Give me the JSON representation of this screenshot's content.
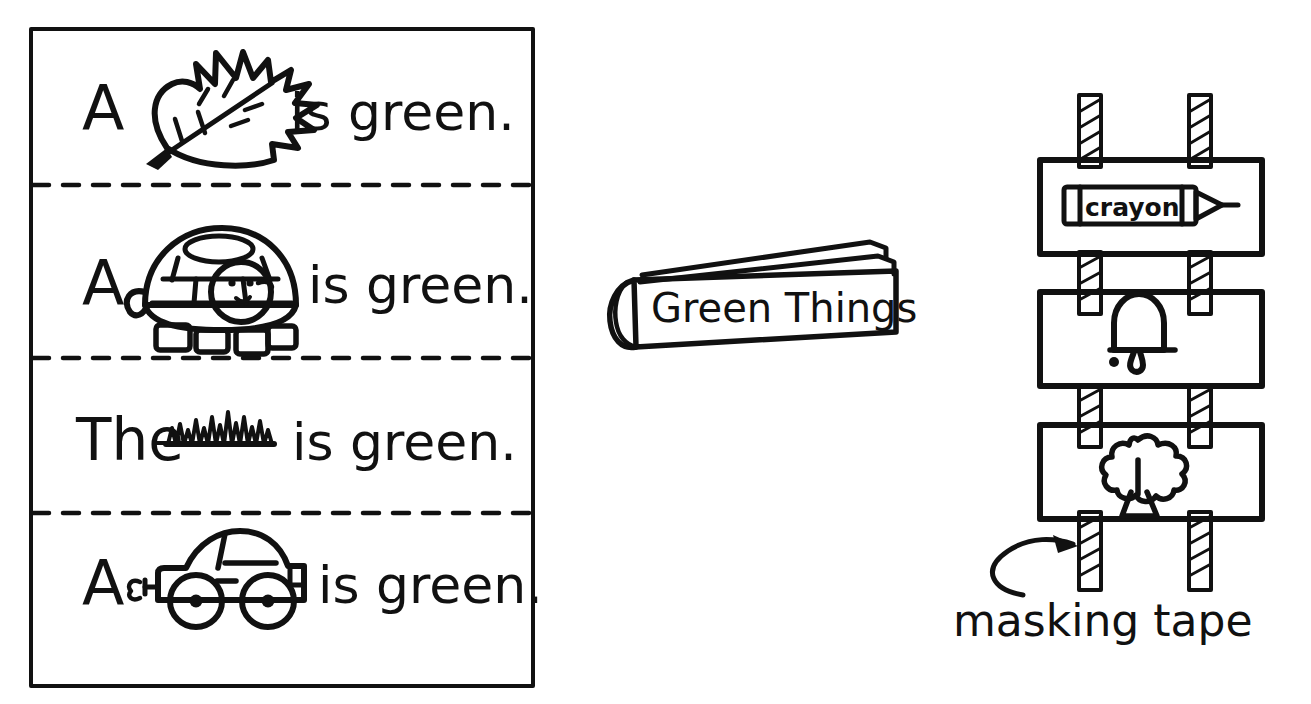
{
  "page": {
    "background_color": "#ffffff",
    "ink_color": "#111111",
    "width": 1311,
    "height": 704
  },
  "sentence_strip_panel": {
    "name": "sentence-strips-box",
    "border_style": "solid",
    "divider_style": "dashed",
    "strips": [
      {
        "index": 1,
        "lead_word": "A",
        "picture": "leaf-icon",
        "picture_label": "leaf",
        "trailing_text": "is green."
      },
      {
        "index": 2,
        "lead_word": "A",
        "picture": "turtle-icon",
        "picture_label": "turtle",
        "trailing_text": "is green."
      },
      {
        "index": 3,
        "lead_word": "The",
        "picture": "grass-icon",
        "picture_label": "grass",
        "trailing_text": "is green."
      },
      {
        "index": 4,
        "lead_word": "A",
        "picture": "car-icon",
        "picture_label": "car",
        "trailing_text": "is green."
      }
    ]
  },
  "book": {
    "name": "green-things-book",
    "cover_title": "Green Things"
  },
  "tape_board": {
    "name": "taped-cards-board",
    "tape_count": 2,
    "tape_label": "masking tape",
    "cards": [
      {
        "index": 1,
        "picture": "crayon-icon",
        "picture_label": "crayon",
        "crayon_wrapper_text": "crayon"
      },
      {
        "index": 2,
        "picture": "bell-icon",
        "picture_label": "bell"
      },
      {
        "index": 3,
        "picture": "tree-icon",
        "picture_label": "tree"
      }
    ]
  },
  "annotation": {
    "name": "masking-tape-callout",
    "text": "masking tape",
    "arrow": "curved-arrow-icon"
  }
}
